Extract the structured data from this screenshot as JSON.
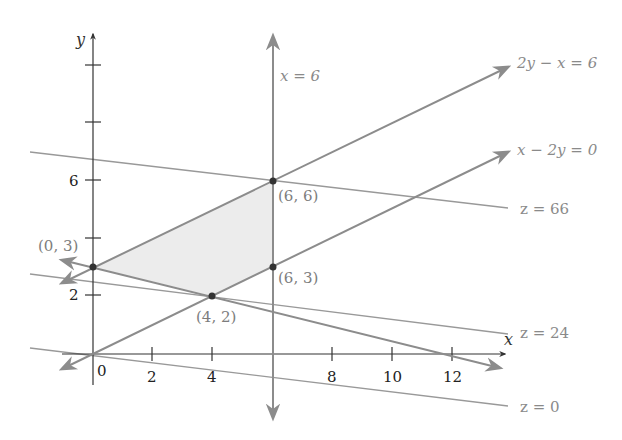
{
  "diagram": {
    "type": "linear-programming-graph",
    "axes": {
      "x_label": "x",
      "y_label": "y",
      "x_ticks": [
        "0",
        "2",
        "4",
        "8",
        "10",
        "12"
      ],
      "y_ticks": [
        "2",
        "6"
      ]
    },
    "lines": {
      "x_eq_6": "x = 6",
      "line_2y_x": "2y − x = 6",
      "line_x_2y": "x − 2y = 0",
      "z66": "z = 66",
      "z24": "z = 24",
      "z0": "z = 0"
    },
    "points": {
      "p03": "(0, 3)",
      "p42": "(4, 2)",
      "p66": "(6, 6)",
      "p63": "(6, 3)"
    },
    "colors": {
      "axis": "#333333",
      "constraint_line": "#8c8c8c",
      "objective_line": "#999999",
      "feasible_region": "#ececec",
      "point": "#333333"
    }
  }
}
